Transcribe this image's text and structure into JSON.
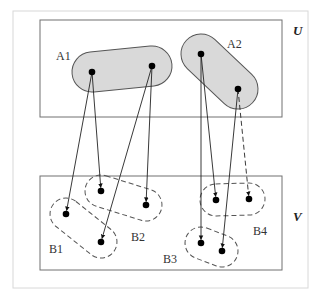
{
  "diagram": {
    "type": "set-mapping",
    "universes": [
      {
        "id": "U",
        "label": "U",
        "box": [
          40,
          20,
          242,
          97
        ],
        "label_pos": [
          293,
          35
        ]
      },
      {
        "id": "V",
        "label": "V",
        "box": [
          40,
          176,
          242,
          94
        ],
        "label_pos": [
          293,
          221
        ]
      }
    ],
    "colors": {
      "frame": "#d8d8d8",
      "box": "#707070",
      "fill_A": "#d9d9d9",
      "stroke_A": "#555555",
      "dashed_B": "#555555",
      "line": "#222222",
      "point": "#000000"
    },
    "A_sets": [
      {
        "id": "A1",
        "label": "A1",
        "label_pos": [
          56,
          60
        ],
        "points": [
          [
            92,
            72
          ],
          [
            152,
            66
          ]
        ]
      },
      {
        "id": "A2",
        "label": "A2",
        "label_pos": [
          227,
          48
        ],
        "points": [
          [
            201,
            54
          ],
          [
            238,
            89
          ]
        ]
      }
    ],
    "B_sets": [
      {
        "id": "B1",
        "label": "B1",
        "label_pos": [
          49,
          253
        ],
        "points": [
          [
            66,
            214
          ],
          [
            101,
            242
          ]
        ]
      },
      {
        "id": "B2",
        "label": "B2",
        "label_pos": [
          131,
          241
        ],
        "points": [
          [
            101,
            191
          ],
          [
            146,
            205
          ]
        ]
      },
      {
        "id": "B3",
        "label": "B3",
        "label_pos": [
          163,
          263
        ],
        "points": [
          [
            201,
            243
          ],
          [
            222,
            251
          ]
        ]
      },
      {
        "id": "B4",
        "label": "B4",
        "label_pos": [
          253,
          235
        ],
        "points": [
          [
            216,
            200
          ],
          [
            249,
            199
          ]
        ]
      }
    ],
    "arrows": [
      {
        "from": [
          92,
          72
        ],
        "to": [
          66,
          214
        ],
        "style": "solid"
      },
      {
        "from": [
          92,
          72
        ],
        "to": [
          101,
          191
        ],
        "style": "solid"
      },
      {
        "from": [
          152,
          66
        ],
        "to": [
          146,
          205
        ],
        "style": "solid"
      },
      {
        "from": [
          152,
          66
        ],
        "to": [
          101,
          242
        ],
        "style": "solid"
      },
      {
        "from": [
          201,
          54
        ],
        "to": [
          201,
          243
        ],
        "style": "solid"
      },
      {
        "from": [
          201,
          54
        ],
        "to": [
          216,
          200
        ],
        "style": "solid"
      },
      {
        "from": [
          238,
          89
        ],
        "to": [
          222,
          251
        ],
        "style": "solid"
      },
      {
        "from": [
          238,
          89
        ],
        "to": [
          249,
          199
        ],
        "style": "dashed"
      }
    ]
  }
}
